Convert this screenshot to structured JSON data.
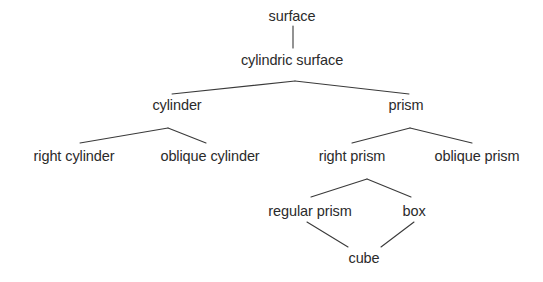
{
  "diagram": {
    "type": "tree",
    "background_color": "#ffffff",
    "text_color": "#2b2b2b",
    "edge_color": "#3a3a3a",
    "nodes": [
      {
        "id": "surface",
        "label": "surface",
        "x": 292,
        "y": 16,
        "level": 0
      },
      {
        "id": "cylindric-surface",
        "label": "cylindric surface",
        "x": 292,
        "y": 60,
        "level": 1
      },
      {
        "id": "cylinder",
        "label": "cylinder",
        "x": 177,
        "y": 105,
        "level": 2
      },
      {
        "id": "prism",
        "label": "prism",
        "x": 406,
        "y": 105,
        "level": 2
      },
      {
        "id": "right-cylinder",
        "label": "right cylinder",
        "x": 74,
        "y": 156,
        "level": 3
      },
      {
        "id": "oblique-cylinder",
        "label": "oblique cylinder",
        "x": 210,
        "y": 156,
        "level": 3
      },
      {
        "id": "right-prism",
        "label": "right prism",
        "x": 352,
        "y": 156,
        "level": 3
      },
      {
        "id": "oblique-prism",
        "label": "oblique prism",
        "x": 477,
        "y": 156,
        "level": 3
      },
      {
        "id": "regular-prism",
        "label": "regular prism",
        "x": 310,
        "y": 211,
        "level": 4
      },
      {
        "id": "box",
        "label": "box",
        "x": 414,
        "y": 211,
        "level": 4
      },
      {
        "id": "cube",
        "label": "cube",
        "x": 364,
        "y": 258,
        "level": 5
      }
    ],
    "edges": [
      {
        "from": "surface",
        "to": "cylindric-surface",
        "x1": 293,
        "y1": 26,
        "x2": 293,
        "y2": 48
      },
      {
        "from": "cylindric-surface",
        "to": "cylinder",
        "x1": 295,
        "y1": 81,
        "x2": 172,
        "y2": 94
      },
      {
        "from": "cylindric-surface",
        "to": "prism",
        "x1": 295,
        "y1": 81,
        "x2": 409,
        "y2": 94
      },
      {
        "from": "cylinder",
        "to": "right-cylinder",
        "x1": 168,
        "y1": 128,
        "x2": 80,
        "y2": 143
      },
      {
        "from": "cylinder",
        "to": "oblique-cylinder",
        "x1": 168,
        "y1": 128,
        "x2": 206,
        "y2": 143
      },
      {
        "from": "prism",
        "to": "right-prism",
        "x1": 410,
        "y1": 128,
        "x2": 352,
        "y2": 143
      },
      {
        "from": "prism",
        "to": "oblique-prism",
        "x1": 410,
        "y1": 128,
        "x2": 472,
        "y2": 143
      },
      {
        "from": "right-prism",
        "to": "regular-prism",
        "x1": 367,
        "y1": 179,
        "x2": 311,
        "y2": 197
      },
      {
        "from": "right-prism",
        "to": "box",
        "x1": 367,
        "y1": 179,
        "x2": 411,
        "y2": 197
      },
      {
        "from": "regular-prism",
        "to": "cube",
        "x1": 307,
        "y1": 222,
        "x2": 348,
        "y2": 247
      },
      {
        "from": "box",
        "to": "cube",
        "x1": 414,
        "y1": 222,
        "x2": 381,
        "y2": 247
      }
    ]
  }
}
